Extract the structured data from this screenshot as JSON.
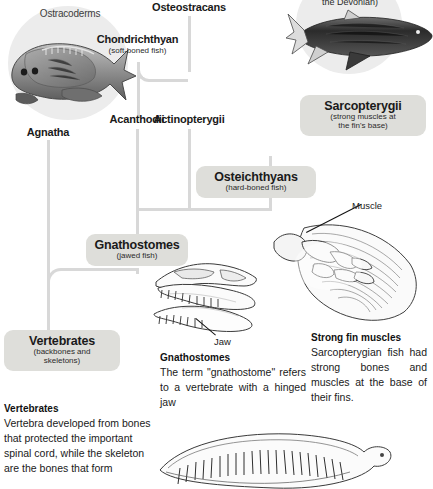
{
  "diagram": {
    "type": "cladogram",
    "title_visible": false,
    "theme": {
      "background": "#ffffff",
      "pill_fill": "#dededa",
      "connector": "#d8d8d8",
      "halo": "#ececec",
      "text": "#1a1a1a"
    },
    "nodes": [
      {
        "id": "ostracoderms",
        "label": "Ostracoderms",
        "sub": "",
        "style": "plain-small"
      },
      {
        "id": "agnatha",
        "label": "Agnatha",
        "sub": "",
        "style": "plain"
      },
      {
        "id": "acanthodii",
        "label": "Acanthodii",
        "sub": "",
        "style": "plain"
      },
      {
        "id": "chondrichthyan",
        "label": "Chondrichthyan",
        "sub": "(soft-boned fish)",
        "style": "plain"
      },
      {
        "id": "osteostracans",
        "label": "Osteostracans",
        "sub": "",
        "style": "plain"
      },
      {
        "id": "actinopterygii",
        "label": "Actinopterygii",
        "sub": "",
        "style": "plain"
      },
      {
        "id": "sarcopterygii",
        "label": "Sarcopterygii",
        "sub": "(strong muscles at\nthe fin's base)",
        "style": "pill"
      },
      {
        "id": "osteichthyans",
        "label": "Osteichthyans",
        "sub": "(hard-boned fish)",
        "style": "pill"
      },
      {
        "id": "gnathostomes",
        "label": "Gnathostomes",
        "sub": "(jawed fish)",
        "style": "pill"
      },
      {
        "id": "vertebrates",
        "label": "Vertebrates",
        "sub": "(backbones and\nskeletons)",
        "style": "pill"
      }
    ],
    "cut_off_label": {
      "id": "devonian-partial",
      "text": "the Devonian)",
      "note_visible": "clipped at top edge of image"
    },
    "callouts": [
      {
        "id": "muscle",
        "text": "Muscle"
      },
      {
        "id": "jaw",
        "text": "Jaw"
      }
    ],
    "captions": [
      {
        "id": "gnathostomes-caption",
        "heading": "Gnathostomes",
        "body": "The term \"gnathostome\" refers to a vertebrate with a hinged jaw"
      },
      {
        "id": "strong-fin-muscles-caption",
        "heading": "Strong fin muscles",
        "body": "Sarcopterygian fish had strong bones and muscles at the base of their fins."
      },
      {
        "id": "vertebrates-caption",
        "heading": "Vertebrates",
        "body": "Vertebra developed from bones that protected the important spinal cord, while the skeleton are the bones that form"
      }
    ],
    "illustrations": [
      {
        "id": "ostracoderm-fish-art",
        "name": "armoured-jawless-fish-illustration"
      },
      {
        "id": "placoderm-fish-art",
        "name": "devonian-fish-illustration"
      },
      {
        "id": "skull-jaw-art",
        "name": "toothed-skull-and-jaw-illustration"
      },
      {
        "id": "lobe-fin-art",
        "name": "lobe-fin-muscle-illustration"
      },
      {
        "id": "vertebral-column-art",
        "name": "vertebral-column-illustration"
      }
    ]
  }
}
